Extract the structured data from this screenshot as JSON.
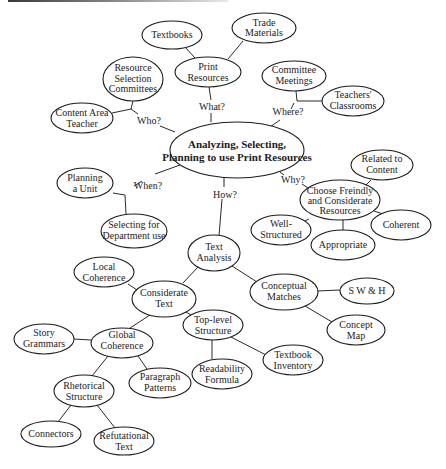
{
  "diagram": {
    "type": "concept-map",
    "central": {
      "line1": "Analyzing, Selecting,",
      "line2": "Planning to use Print Resources"
    },
    "edge_labels": {
      "what": "What?",
      "who": "Who?",
      "where": "Where?",
      "when": "When?",
      "why": "Why?",
      "how": "How?"
    },
    "nodes": {
      "textbooks": [
        "Textbooks"
      ],
      "trade_materials": [
        "Trade",
        "Materials"
      ],
      "print_resources": [
        "Print",
        "Resources"
      ],
      "resource_selection_committees": [
        "Resource",
        "Selection",
        "Committees"
      ],
      "committee_meetings": [
        "Committee",
        "Meetings"
      ],
      "teachers_classrooms": [
        "Teachers'",
        "Classrooms"
      ],
      "content_area_teacher": [
        "Content Area",
        "Teacher"
      ],
      "related_to_content": [
        "Related to",
        "Content"
      ],
      "planning_a_unit": [
        "Planning",
        "a Unit"
      ],
      "choose_resources": [
        "Choose Freindly",
        "and Considerate",
        "Resources"
      ],
      "coherent": [
        "Coherent"
      ],
      "well_structured": [
        "Well-",
        "Structured"
      ],
      "appropriate": [
        "Appropriate"
      ],
      "selecting_for_department": [
        "Selecting for",
        "Department use"
      ],
      "text_analysis": [
        "Text",
        "Analysis"
      ],
      "local_coherence": [
        "Local",
        "Coherence"
      ],
      "considerate_text": [
        "Considerate",
        "Text"
      ],
      "conceptual_matches": [
        "Conceptual",
        "Matches"
      ],
      "swh": [
        "S W & H"
      ],
      "top_level_structure": [
        "Top-level",
        "Structure"
      ],
      "concept_map": [
        "Concept",
        "Map"
      ],
      "story_grammars": [
        "Story",
        "Grammars"
      ],
      "global_coherence": [
        "Global",
        "Coherence"
      ],
      "textbook_inventory": [
        "Textbook",
        "Inventory"
      ],
      "readability_formula": [
        "Readability",
        "Formula"
      ],
      "paragraph_patterns": [
        "Paragraph",
        "Patterns"
      ],
      "rhetorical_structure": [
        "Rhetorical",
        "Structure"
      ],
      "connectors": [
        "Connectors"
      ],
      "refutational_text": [
        "Refutational",
        "Text"
      ]
    },
    "colors": {
      "stroke": "#1c1c1c",
      "fill": "#ffffff",
      "text": "#1c1c1c"
    }
  }
}
